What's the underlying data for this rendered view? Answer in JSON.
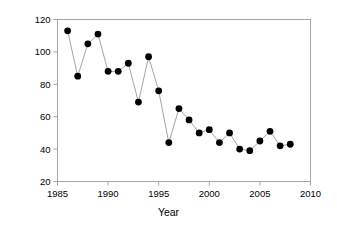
{
  "chart_data": {
    "type": "line",
    "title": "",
    "xlabel": "Year",
    "ylabel": "Number of territories",
    "xlim": [
      1985,
      2010
    ],
    "ylim": [
      20,
      120
    ],
    "xticks": [
      1985,
      1990,
      1995,
      2000,
      2005,
      2010
    ],
    "yticks": [
      20,
      40,
      60,
      80,
      100,
      120
    ],
    "grid": false,
    "legend": "none",
    "marker": "filled-circle",
    "marker_color": "#000000",
    "line_color": "#9a9a9a",
    "x": [
      1986,
      1987,
      1988,
      1989,
      1990,
      1991,
      1992,
      1993,
      1994,
      1995,
      1996,
      1997,
      1998,
      1999,
      2000,
      2001,
      2002,
      2003,
      2004,
      2005,
      2006,
      2007,
      2008
    ],
    "values": [
      113,
      85,
      105,
      111,
      88,
      88,
      93,
      69,
      97,
      76,
      44,
      65,
      58,
      50,
      52,
      44,
      50,
      40,
      39,
      45,
      51,
      42,
      43
    ],
    "series": [
      {
        "name": "Number of territories",
        "values": [
          113,
          85,
          105,
          111,
          88,
          88,
          93,
          69,
          97,
          76,
          44,
          65,
          58,
          50,
          52,
          44,
          50,
          40,
          39,
          45,
          51,
          42,
          43
        ]
      }
    ]
  },
  "axes": {
    "x_title": "Year",
    "y_title": "Number of territories",
    "x_tick_labels": [
      "1985",
      "1990",
      "1995",
      "2000",
      "2005",
      "2010"
    ],
    "y_tick_labels": [
      "20",
      "40",
      "60",
      "80",
      "100",
      "120"
    ]
  }
}
